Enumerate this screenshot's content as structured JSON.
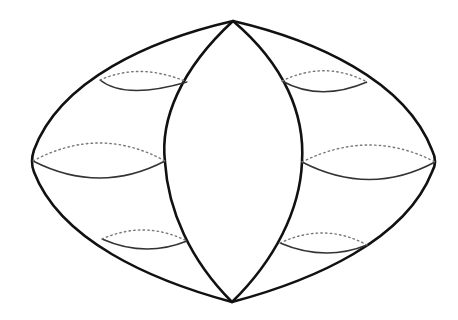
{
  "diagram": {
    "type": "geometric-line-drawing",
    "colors": {
      "background": "#ffffff",
      "stroke": "#111111",
      "dotted": "#777777"
    },
    "vertices": {
      "top": [
        233,
        21
      ],
      "bottom": [
        232,
        302
      ],
      "left": [
        32,
        160
      ],
      "right": [
        436,
        162
      ]
    },
    "cross_sections": {
      "left": 3,
      "right": 3
    }
  }
}
